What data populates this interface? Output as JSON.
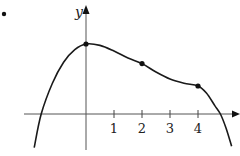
{
  "chart_data": {
    "type": "line",
    "title": "",
    "xlabel": "x",
    "ylabel": "y",
    "x_ticks": [
      "1",
      "2",
      "3",
      "4"
    ],
    "x_tick_values": [
      1,
      2,
      3,
      4
    ],
    "xlim": [
      -3.0,
      5.5
    ],
    "ylim": [
      -1.3,
      3.8
    ],
    "grid": false,
    "legend": null,
    "series": [
      {
        "name": "f(x)",
        "x": [
          -1.85,
          -1.6,
          -1.2,
          -0.8,
          -0.4,
          0,
          0.5,
          1.0,
          1.5,
          2.0,
          2.5,
          3.0,
          3.5,
          4.0,
          4.3,
          4.6,
          4.8,
          5.0,
          5.2
        ],
        "values": [
          -1.2,
          0.0,
          1.1,
          1.85,
          2.3,
          2.5,
          2.45,
          2.25,
          2.0,
          1.8,
          1.5,
          1.25,
          1.1,
          1.0,
          0.75,
          0.3,
          0.0,
          -0.5,
          -1.15
        ]
      }
    ],
    "marked_points": [
      {
        "x": 0,
        "y": 2.5
      },
      {
        "x": 2,
        "y": 1.8
      },
      {
        "x": 4,
        "y": 1.0
      }
    ],
    "annotations": [
      "•"
    ]
  }
}
